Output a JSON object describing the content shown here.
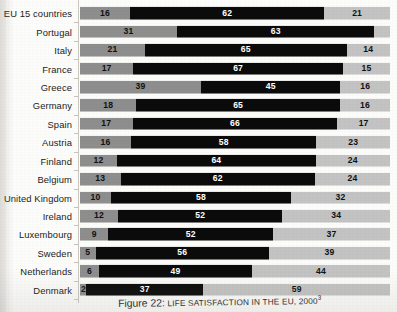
{
  "chart_data": {
    "type": "bar",
    "subtype": "stacked-horizontal-100",
    "title": "Figure 22: LIFE SATISFACTION IN THE EU, 2000",
    "title_figure_number": "Figure 22:",
    "title_text": "LIFE SATISFACTION IN THE EU, 2000",
    "title_footnote": "3",
    "xlabel": "",
    "ylabel": "",
    "xlim": [
      0,
      100
    ],
    "grid": false,
    "legend_position": "none",
    "categories": [
      "EU 15 countries",
      "Portugal",
      "Italy",
      "France",
      "Greece",
      "Germany",
      "Spain",
      "Austria",
      "Finland",
      "Belgium",
      "United Kingdom",
      "Ireland",
      "Luxembourg",
      "Sweden",
      "Netherlands",
      "Denmark"
    ],
    "series": [
      {
        "name": "segment-1",
        "color": "#8e8e8e",
        "values": [
          16,
          31,
          21,
          17,
          39,
          18,
          17,
          16,
          12,
          13,
          10,
          12,
          9,
          5,
          6,
          2
        ]
      },
      {
        "name": "segment-2",
        "color": "#0b0b0b",
        "values": [
          62,
          63,
          65,
          67,
          45,
          65,
          66,
          58,
          64,
          62,
          58,
          52,
          52,
          56,
          49,
          37
        ]
      },
      {
        "name": "segment-3",
        "color": "#c3c3c3",
        "values": [
          21,
          5,
          14,
          15,
          16,
          16,
          17,
          23,
          24,
          24,
          32,
          34,
          37,
          39,
          44,
          59
        ]
      }
    ],
    "rows": [
      {
        "label": "EU 15 countries",
        "values": [
          16,
          62,
          21
        ]
      },
      {
        "label": "Portugal",
        "values": [
          31,
          63,
          5
        ]
      },
      {
        "label": "Italy",
        "values": [
          21,
          65,
          14
        ]
      },
      {
        "label": "France",
        "values": [
          17,
          67,
          15
        ]
      },
      {
        "label": "Greece",
        "values": [
          39,
          45,
          16
        ]
      },
      {
        "label": "Germany",
        "values": [
          18,
          65,
          16
        ]
      },
      {
        "label": "Spain",
        "values": [
          17,
          66,
          17
        ]
      },
      {
        "label": "Austria",
        "values": [
          16,
          58,
          23
        ]
      },
      {
        "label": "Finland",
        "values": [
          12,
          64,
          24
        ]
      },
      {
        "label": "Belgium",
        "values": [
          13,
          62,
          24
        ]
      },
      {
        "label": "United Kingdom",
        "values": [
          10,
          58,
          32
        ]
      },
      {
        "label": "Ireland",
        "values": [
          12,
          52,
          34
        ]
      },
      {
        "label": "Luxembourg",
        "values": [
          9,
          52,
          37
        ]
      },
      {
        "label": "Sweden",
        "values": [
          5,
          56,
          39
        ]
      },
      {
        "label": "Netherlands",
        "values": [
          6,
          49,
          44
        ]
      },
      {
        "label": "Denmark",
        "values": [
          2,
          37,
          59
        ]
      }
    ]
  }
}
